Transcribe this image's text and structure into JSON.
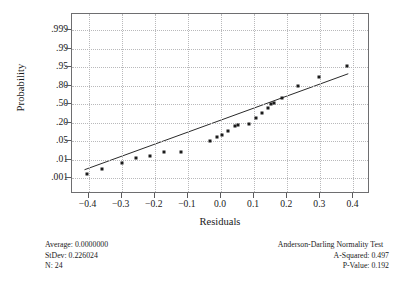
{
  "chart_data": {
    "type": "scatter",
    "title": "",
    "xlabel": "Residuals",
    "ylabel": "Probability",
    "xlim": [
      -0.45,
      0.45
    ],
    "ylim_probability": [
      0.001,
      0.999
    ],
    "grid": true,
    "legend": "none",
    "x_ticks": [
      "-0.4",
      "-0.3",
      "-0.2",
      "-0.1",
      "0.0",
      "0.1",
      "0.2",
      "0.3",
      "0.4"
    ],
    "x_tick_values": [
      -0.4,
      -0.3,
      -0.2,
      -0.1,
      0.0,
      0.1,
      0.2,
      0.3,
      0.4
    ],
    "y_ticks": [
      ".999",
      ".99",
      ".95",
      ".80",
      ".50",
      ".20",
      ".05",
      ".01",
      ".001"
    ],
    "y_tick_values": [
      0.999,
      0.99,
      0.95,
      0.8,
      0.5,
      0.2,
      0.05,
      0.01,
      0.001
    ],
    "series": [
      {
        "name": "Residuals",
        "marker": "square",
        "color": "#1b1b1b",
        "points": [
          {
            "x": -0.405,
            "y": 0.028
          },
          {
            "x": -0.358,
            "y": 0.062
          },
          {
            "x": -0.3,
            "y": 0.102
          },
          {
            "x": -0.258,
            "y": 0.132
          },
          {
            "x": -0.213,
            "y": 0.152
          },
          {
            "x": -0.172,
            "y": 0.176
          },
          {
            "x": -0.12,
            "y": 0.176
          },
          {
            "x": -0.032,
            "y": 0.248
          },
          {
            "x": -0.013,
            "y": 0.28
          },
          {
            "x": 0.002,
            "y": 0.292
          },
          {
            "x": 0.02,
            "y": 0.32
          },
          {
            "x": 0.043,
            "y": 0.352
          },
          {
            "x": 0.052,
            "y": 0.36
          },
          {
            "x": 0.084,
            "y": 0.368
          },
          {
            "x": 0.105,
            "y": 0.408
          },
          {
            "x": 0.124,
            "y": 0.44
          },
          {
            "x": 0.142,
            "y": 0.472
          },
          {
            "x": 0.15,
            "y": 0.5
          },
          {
            "x": 0.16,
            "y": 0.508
          },
          {
            "x": 0.184,
            "y": 0.54
          },
          {
            "x": 0.232,
            "y": 0.624
          },
          {
            "x": 0.296,
            "y": 0.68
          },
          {
            "x": 0.38,
            "y": 0.756
          }
        ]
      }
    ],
    "fit_line": {
      "name": "normal-fit-line",
      "color": "#2a2a2a",
      "x1": -0.412,
      "y1": 0.044,
      "x2": 0.39,
      "y2": 0.7
    }
  },
  "axes": {
    "y_title": "Probability",
    "x_title": "Residuals"
  },
  "stats_left": {
    "average": "Average: 0.0000000",
    "stdev": "StDev: 0.226024",
    "n": "N: 24"
  },
  "stats_right": {
    "test_title": "Anderson-Darling Normality Test",
    "a_squared": "A-Squared: 0.497",
    "p_value": "P-Value:   0.192"
  }
}
